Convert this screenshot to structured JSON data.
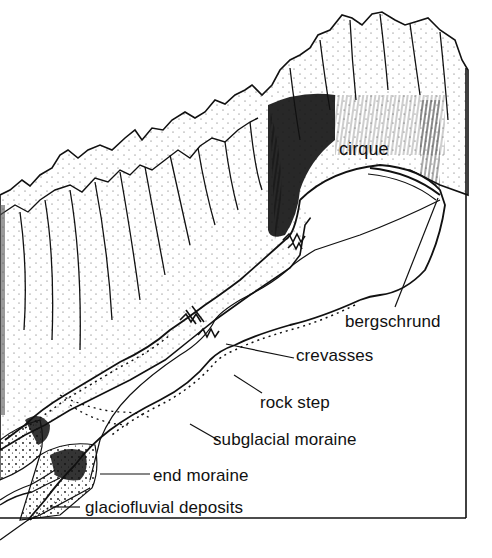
{
  "diagram": {
    "frame_color": "#111111",
    "ink_color": "#111111",
    "background_color": "#ffffff",
    "labels": {
      "cirque": "cirque",
      "bergschrund": "bergschrund",
      "crevasses": "crevasses",
      "rock_step": "rock step",
      "subglacial_moraine": "subglacial moraine",
      "end_moraine": "end moraine",
      "glaciofluvial_deposits": "glaciofluvial deposits"
    }
  }
}
